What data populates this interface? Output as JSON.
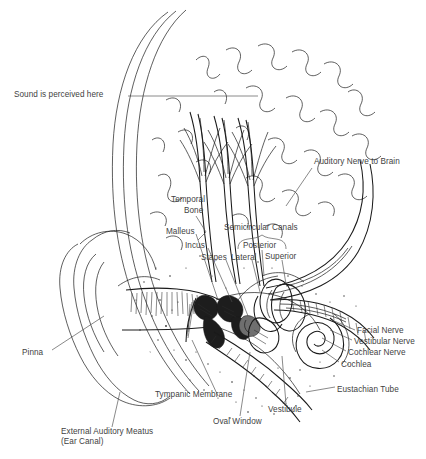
{
  "figure": {
    "style": "pen-and-ink line drawing",
    "background_color": "#ffffff",
    "ink_color": "#1a1a1a",
    "label_color": "#3f3f3f"
  },
  "labels": [
    {
      "id": "sound-perceived",
      "text": "Sound is perceived here",
      "x": 14,
      "y": 94,
      "align": "left"
    },
    {
      "id": "auditory-nerve",
      "text": "Auditory Nerve to Brain",
      "x": 314,
      "y": 161,
      "align": "left"
    },
    {
      "id": "temporal-bone-1",
      "text": "Temporal",
      "x": 171,
      "y": 199,
      "align": "left"
    },
    {
      "id": "temporal-bone-2",
      "text": "Bone",
      "x": 184,
      "y": 210,
      "align": "left"
    },
    {
      "id": "malleus",
      "text": "Malleus",
      "x": 166,
      "y": 231,
      "align": "left"
    },
    {
      "id": "incus",
      "text": "Incus",
      "x": 185,
      "y": 245,
      "align": "left"
    },
    {
      "id": "stapes",
      "text": "Stapes",
      "x": 201,
      "y": 257,
      "align": "left"
    },
    {
      "id": "semicircular-canals",
      "text": "Semicircular Canals",
      "x": 224,
      "y": 227,
      "align": "left"
    },
    {
      "id": "posterior",
      "text": "Posterior",
      "x": 243,
      "y": 245,
      "align": "left"
    },
    {
      "id": "lateral",
      "text": "Lateral",
      "x": 231,
      "y": 257,
      "align": "left"
    },
    {
      "id": "superior",
      "text": "Superior",
      "x": 265,
      "y": 256,
      "align": "left"
    },
    {
      "id": "facial-nerve",
      "text": "Facial Nerve",
      "x": 357,
      "y": 330,
      "align": "left"
    },
    {
      "id": "vestibular-nerve",
      "text": "Vestibular Nerve",
      "x": 354,
      "y": 341,
      "align": "left"
    },
    {
      "id": "cochlear-nerve",
      "text": "Cochlear Nerve",
      "x": 348,
      "y": 352,
      "align": "left"
    },
    {
      "id": "cochlea",
      "text": "Cochlea",
      "x": 341,
      "y": 364,
      "align": "left"
    },
    {
      "id": "eustachian-tube",
      "text": "Eustachian Tube",
      "x": 337,
      "y": 389,
      "align": "left"
    },
    {
      "id": "pinna",
      "text": "Pinna",
      "x": 22,
      "y": 352,
      "align": "left"
    },
    {
      "id": "tympanic-membrane",
      "text": "Tympanic Membrane",
      "x": 155,
      "y": 394,
      "align": "left"
    },
    {
      "id": "oval-window",
      "text": "Oval Window",
      "x": 213,
      "y": 421,
      "align": "left"
    },
    {
      "id": "vestibule",
      "text": "Vestibule",
      "x": 268,
      "y": 409,
      "align": "left"
    },
    {
      "id": "external-meatus-1",
      "text": "External Auditory Meatus",
      "x": 61,
      "y": 431,
      "align": "left"
    },
    {
      "id": "external-meatus-2",
      "text": "(Ear Canal)",
      "x": 61,
      "y": 441,
      "align": "left"
    }
  ],
  "anatomy_parts": [
    "pinna",
    "external auditory meatus",
    "tympanic membrane",
    "malleus",
    "incus",
    "stapes",
    "oval window",
    "vestibule",
    "semicircular canals",
    "cochlea",
    "cochlear nerve",
    "vestibular nerve",
    "facial nerve",
    "auditory nerve",
    "eustachian tube",
    "temporal bone",
    "brain tissue"
  ]
}
